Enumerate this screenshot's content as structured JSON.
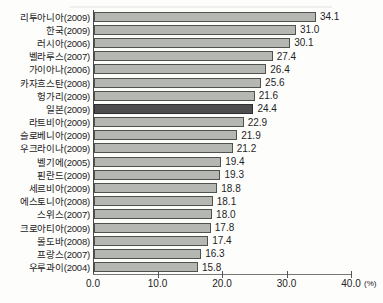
{
  "chart_data": {
    "type": "bar",
    "orientation": "horizontal",
    "title": "",
    "xlabel": "",
    "ylabel": "",
    "x_unit_label": "(%)",
    "xlim": [
      0,
      40
    ],
    "x_ticks": [
      "0.0",
      "10.0",
      "20.0",
      "30.0",
      "40.0"
    ],
    "grid": false,
    "legend": false,
    "highlighted_category": "일본(2009)",
    "categories": [
      "리투아니아(2009)",
      "한국(2009)",
      "러시아(2006)",
      "벨라루스(2007)",
      "가이아나(2006)",
      "카자흐스탄(2008)",
      "헝가리(2009)",
      "일본(2009)",
      "라트비아(2009)",
      "슬로베니아(2009)",
      "우크라이나(2009)",
      "벨기에(2005)",
      "핀란드(2009)",
      "세르비아(2009)",
      "에스토니아(2008)",
      "스위스(2007)",
      "크로아티아(2009)",
      "몰도바(2008)",
      "프랑스(2007)",
      "우루과이(2004)"
    ],
    "rows": [
      {
        "label": "리투아니아(2009)",
        "value": "34.1",
        "bar": 34.1,
        "highlight": false
      },
      {
        "label": "한국(2009)",
        "value": "31.0",
        "bar": 31.0,
        "highlight": false
      },
      {
        "label": "러시아(2006)",
        "value": "30.1",
        "bar": 30.1,
        "highlight": false
      },
      {
        "label": "벨라루스(2007)",
        "value": "27.4",
        "bar": 27.4,
        "highlight": false
      },
      {
        "label": "가이아나(2006)",
        "value": "26.4",
        "bar": 26.4,
        "highlight": false
      },
      {
        "label": "카자흐스탄(2008)",
        "value": "25.6",
        "bar": 25.6,
        "highlight": false
      },
      {
        "label": "헝가리(2009)",
        "value": "21.6",
        "bar": 24.6,
        "highlight": false
      },
      {
        "label": "일본(2009)",
        "value": "24.4",
        "bar": 24.4,
        "highlight": true
      },
      {
        "label": "라트비아(2009)",
        "value": "22.9",
        "bar": 22.9,
        "highlight": false
      },
      {
        "label": "슬로베니아(2009)",
        "value": "21.9",
        "bar": 21.9,
        "highlight": false
      },
      {
        "label": "우크라이나(2009)",
        "value": "21.2",
        "bar": 21.2,
        "highlight": false
      },
      {
        "label": "벨기에(2005)",
        "value": "19.4",
        "bar": 19.4,
        "highlight": false
      },
      {
        "label": "핀란드(2009)",
        "value": "19.3",
        "bar": 19.3,
        "highlight": false
      },
      {
        "label": "세르비아(2009)",
        "value": "18.8",
        "bar": 18.8,
        "highlight": false
      },
      {
        "label": "에스토니아(2008)",
        "value": "18.1",
        "bar": 18.1,
        "highlight": false
      },
      {
        "label": "스위스(2007)",
        "value": "18.0",
        "bar": 18.0,
        "highlight": false
      },
      {
        "label": "크로아티아(2009)",
        "value": "17.8",
        "bar": 17.8,
        "highlight": false
      },
      {
        "label": "몰도바(2008)",
        "value": "17.4",
        "bar": 17.4,
        "highlight": false
      },
      {
        "label": "프랑스(2007)",
        "value": "16.3",
        "bar": 16.3,
        "highlight": false
      },
      {
        "label": "우루과이(2004)",
        "value": "15.8",
        "bar": 15.8,
        "highlight": false
      }
    ],
    "colors": {
      "background": "#fdfdfc",
      "bar_fill": "#b5b7b2",
      "bar_border": "#50524e",
      "highlight_fill": "#4e4e4e",
      "highlight_border": "#2e2e2e",
      "axis": "#777773",
      "text": "#1f1f1f"
    }
  }
}
